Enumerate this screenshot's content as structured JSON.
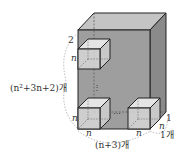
{
  "diagram": {
    "colors": {
      "front_face": "#9e9e9e",
      "top_face": "#c4c4c4",
      "right_face": "#8a8a8a",
      "cube_face": "#d6d6d6",
      "cube_top": "#e4e4e4",
      "edge": "#222222",
      "dashed": "#777777",
      "arc": "#999999"
    },
    "labels": {
      "top_gap": "2",
      "cube_side_left_top": "n",
      "height_count": "(n²+3n+2)개",
      "cube_side_left_bottom": "n",
      "cube_width_bottom_left": "n",
      "cube_width_bottom_right": "n",
      "width_count": "(n+3)개",
      "depth_gap": "1",
      "cube_depth": "n",
      "depth_count": "1개",
      "dots": "⋯",
      "vdots": "⋮"
    }
  }
}
